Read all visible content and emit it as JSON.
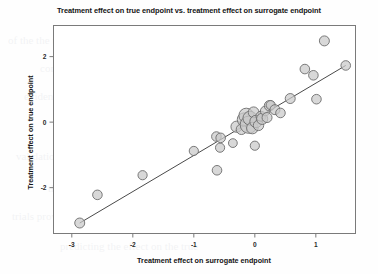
{
  "chart_data": {
    "type": "scatter",
    "title": "Treatment effect on true endpoint vs. treatment effect on surrogate endpoint",
    "xlabel": "Treatment effect on surrogate endpoint",
    "ylabel": "Treatment effect on true endpoint",
    "xlim": [
      -3.3,
      1.65
    ],
    "ylim": [
      -3.4,
      2.95
    ],
    "xticks": [
      -3,
      -2,
      -1,
      0,
      1
    ],
    "xticklabels": [
      "-3",
      "-2",
      "-1",
      "0",
      "1"
    ],
    "yticks": [
      2,
      0,
      -2
    ],
    "yticklabels": [
      "2",
      "0",
      "-2"
    ],
    "grid": false,
    "legend": null,
    "marker": {
      "shape": "circle",
      "fill_color": "#c9c9c9",
      "edge_color": "#6d6d6d",
      "size_encodes": "study-weight"
    },
    "regression_line": {
      "label": "fitted regression line",
      "color": "#4a4a4a",
      "x_start": -2.87,
      "y_start": -3.08,
      "x_end": 1.49,
      "y_end": 1.73
    },
    "points": [
      {
        "x": -2.87,
        "y": -3.08,
        "size": 5.0
      },
      {
        "x": -2.58,
        "y": -2.22,
        "size": 4.8
      },
      {
        "x": -1.84,
        "y": -1.62,
        "size": 4.6
      },
      {
        "x": -1.0,
        "y": -0.88,
        "size": 4.6
      },
      {
        "x": -0.62,
        "y": -1.47,
        "size": 4.8
      },
      {
        "x": -0.63,
        "y": -0.44,
        "size": 4.8
      },
      {
        "x": -0.57,
        "y": -0.78,
        "size": 4.6
      },
      {
        "x": -0.56,
        "y": -0.48,
        "size": 4.8
      },
      {
        "x": -0.36,
        "y": -0.64,
        "size": 4.4
      },
      {
        "x": -0.3,
        "y": -0.14,
        "size": 5.6
      },
      {
        "x": -0.22,
        "y": -0.22,
        "size": 5.2
      },
      {
        "x": -0.18,
        "y": 0.08,
        "size": 6.6
      },
      {
        "x": -0.14,
        "y": 0.2,
        "size": 7.4
      },
      {
        "x": -0.1,
        "y": -0.08,
        "size": 8.6
      },
      {
        "x": -0.08,
        "y": 0.12,
        "size": 7.0
      },
      {
        "x": -0.04,
        "y": -0.18,
        "size": 5.8
      },
      {
        "x": -0.02,
        "y": 0.3,
        "size": 5.4
      },
      {
        "x": 0.0,
        "y": -0.72,
        "size": 4.6
      },
      {
        "x": 0.02,
        "y": 0.02,
        "size": 6.2
      },
      {
        "x": 0.06,
        "y": -0.1,
        "size": 5.2
      },
      {
        "x": 0.1,
        "y": 0.18,
        "size": 5.0
      },
      {
        "x": 0.12,
        "y": 0.1,
        "size": 5.6
      },
      {
        "x": 0.17,
        "y": 0.34,
        "size": 4.8
      },
      {
        "x": 0.2,
        "y": 0.14,
        "size": 5.0
      },
      {
        "x": 0.24,
        "y": 0.5,
        "size": 5.2
      },
      {
        "x": 0.26,
        "y": 0.52,
        "size": 4.6
      },
      {
        "x": 0.33,
        "y": 0.38,
        "size": 5.0
      },
      {
        "x": 0.42,
        "y": 0.28,
        "size": 4.8
      },
      {
        "x": 0.58,
        "y": 0.72,
        "size": 5.0
      },
      {
        "x": 0.82,
        "y": 1.62,
        "size": 4.8
      },
      {
        "x": 0.96,
        "y": 1.43,
        "size": 4.8
      },
      {
        "x": 1.01,
        "y": 0.7,
        "size": 4.8
      },
      {
        "x": 1.14,
        "y": 2.48,
        "size": 5.0
      },
      {
        "x": 1.49,
        "y": 1.73,
        "size": 4.8
      }
    ]
  },
  "axes_frame": {
    "border_color": "#7a7a7a",
    "background": "#ffffff"
  },
  "bleed_text": [
    "of the the treatment a surrogate",
    "correlation between the effects",
    "evidence for a surrogate endpoint",
    "meta-analysis of randomised trials",
    "validation criteria and measures",
    "the relationship observed across",
    "trials provides the basis for",
    "predicting the effect on the true"
  ]
}
